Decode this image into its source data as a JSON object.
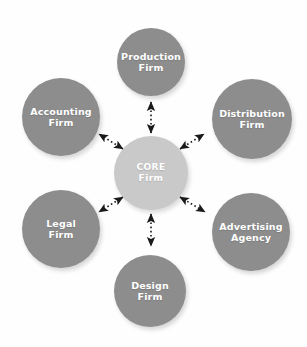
{
  "diagram": {
    "type": "hub-and-spoke",
    "background_color": "#fefefe",
    "core_color": "#c9c9c9",
    "node_color": "#8d8d8d",
    "label_color": "#ffffff",
    "connector_color": "#1a1a1a",
    "connector_style": "dotted double-headed arrow",
    "core": {
      "id": "core-firm",
      "line1": "CORE",
      "line2": "Firm",
      "cx": 151,
      "cy": 173,
      "r": 37
    },
    "nodes": [
      {
        "id": "production-firm",
        "line1": "Production",
        "line2": "Firm",
        "cx": 151,
        "cy": 62,
        "r": 34,
        "position": "top"
      },
      {
        "id": "distribution-firm",
        "line1": "Distribution",
        "line2": "Firm",
        "cx": 252,
        "cy": 119,
        "r": 40,
        "position": "top-right"
      },
      {
        "id": "advertising-agency",
        "line1": "Advertising",
        "line2": "Agency",
        "cx": 251,
        "cy": 232,
        "r": 39,
        "position": "bottom-right"
      },
      {
        "id": "design-firm",
        "line1": "Design",
        "line2": "Firm",
        "cx": 150,
        "cy": 291,
        "r": 36,
        "position": "bottom"
      },
      {
        "id": "legal-firm",
        "line1": "Legal",
        "line2": "Firm",
        "cx": 61,
        "cy": 229,
        "r": 39,
        "position": "bottom-left"
      },
      {
        "id": "accounting-firm",
        "line1": "Accounting",
        "line2": "Firm",
        "cx": 61,
        "cy": 117,
        "r": 39,
        "position": "top-left"
      }
    ],
    "connectors": [
      {
        "id": "connector-core-production",
        "from": "core-firm",
        "to": "production-firm"
      },
      {
        "id": "connector-core-distribution",
        "from": "core-firm",
        "to": "distribution-firm"
      },
      {
        "id": "connector-core-advertising",
        "from": "core-firm",
        "to": "advertising-agency"
      },
      {
        "id": "connector-core-design",
        "from": "core-firm",
        "to": "design-firm"
      },
      {
        "id": "connector-core-legal",
        "from": "core-firm",
        "to": "legal-firm"
      },
      {
        "id": "connector-core-accounting",
        "from": "core-firm",
        "to": "accounting-firm"
      }
    ]
  }
}
